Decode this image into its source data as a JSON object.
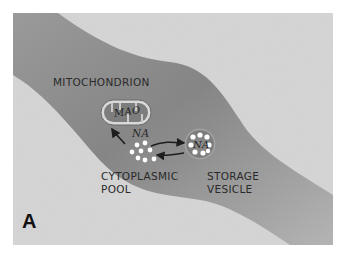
{
  "figure": {
    "panel_label": "A",
    "labels": {
      "mitochondrion": "MITOCHONDRION",
      "mao": "MAO",
      "na_cytoplasmic": "NA",
      "na_vesicle": "NA",
      "cytoplasmic_line1": "CYTOPLASMIC",
      "cytoplasmic_line2": "POOL",
      "storage_line1": "STORAGE",
      "storage_line2": "VESICLE"
    },
    "colors": {
      "background_speckle": "#d2d2d2",
      "axon_band": "#8f8f8f",
      "axon_band_light": "#b9b9b9",
      "organelle": "#7a7a7a",
      "dots": "#ffffff",
      "arrows": "#1e1e1e"
    }
  }
}
